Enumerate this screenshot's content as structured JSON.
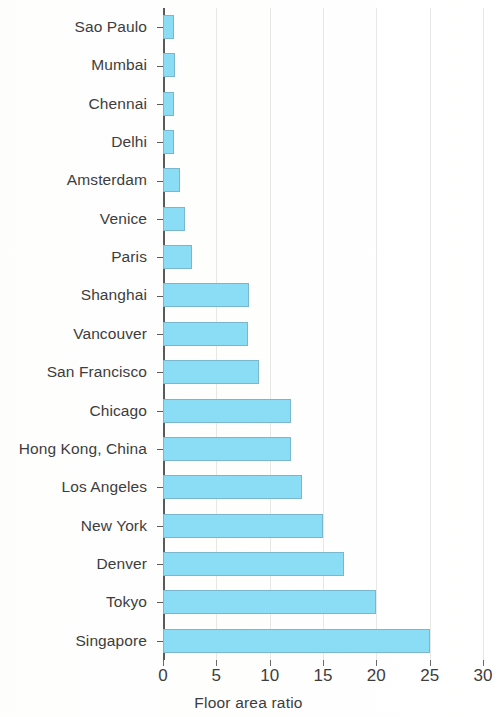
{
  "chart_data": {
    "type": "bar",
    "orientation": "horizontal",
    "title": "",
    "subtitle": "",
    "xlabel": "Floor area ratio",
    "ylabel": "",
    "xlim": [
      0,
      30
    ],
    "xticks": [
      0,
      5,
      10,
      15,
      20,
      25,
      30
    ],
    "xtick_labels": [
      "0",
      "5",
      "10",
      "15",
      "20",
      "25",
      "30"
    ],
    "grid": true,
    "grid_axis": "x",
    "legend": false,
    "legend_position": "none",
    "bar_color": "#8bdcf5",
    "bar_edge_color": "#7ab6cd",
    "axis_color": "#5a5a5a",
    "categories": [
      "Sao Paulo",
      "Mumbai",
      "Chennai",
      "Delhi",
      "Amsterdam",
      "Venice",
      "Paris",
      "Shanghai",
      "Vancouver",
      "San Francisco",
      "Chicago",
      "Hong Kong, China",
      "Los Angeles",
      "New York",
      "Denver",
      "Tokyo",
      "Singapore"
    ],
    "values": [
      1.0,
      1.1,
      1.0,
      1.0,
      1.6,
      2.1,
      2.7,
      8.1,
      8.0,
      9.0,
      12.0,
      12.0,
      13.0,
      15.0,
      17.0,
      20.0,
      25.0
    ]
  }
}
